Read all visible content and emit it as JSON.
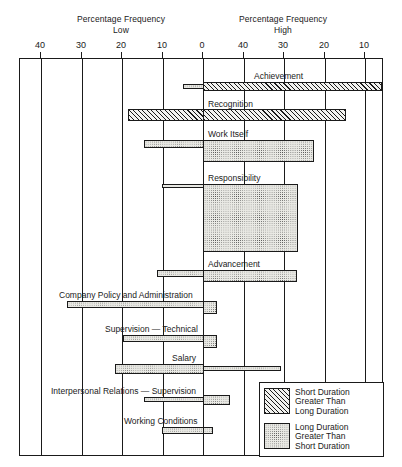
{
  "chart_data": {
    "type": "bar",
    "title": "",
    "subtitle": "",
    "orientation": "horizontal-diverging",
    "axes": {
      "left": {
        "title_line1": "Percentage Frequency",
        "title_line2": "Low",
        "ticks": [
          40,
          30,
          20,
          10,
          0
        ],
        "range": [
          40,
          0
        ],
        "direction": "decreasing-rightward"
      },
      "right": {
        "title_line1": "Percentage Frequency",
        "title_line2": "High",
        "ticks": [
          0,
          40,
          30,
          20,
          10
        ],
        "range": [
          0,
          50
        ],
        "direction": "increasing-leftward"
      }
    },
    "grid": true,
    "legend": {
      "position": "bottom-right-inside",
      "entries": [
        {
          "pattern": "hatch",
          "line1": "Short Duration",
          "line2": "Greater Than",
          "line3": "Long Duration"
        },
        {
          "pattern": "dots",
          "line1": "Long Duration",
          "line2": "Greater Than",
          "line3": "Short Duration"
        }
      ]
    },
    "categories": [
      "Achievement",
      "Recognition",
      "Work Itself",
      "Responsibility",
      "Advancement",
      "Company Policy and Administration",
      "Supervision — Technical",
      "Salary",
      "Interpersonal Relations — Supervision",
      "Working Conditions"
    ],
    "series": [
      {
        "name": "Low (left of centre)",
        "values": [
          5,
          18.5,
          14.5,
          10,
          8,
          40,
          20,
          25,
          13,
          9
        ]
      },
      {
        "name": "High (right of centre)",
        "values": [
          44,
          35,
          27,
          22,
          23,
          3,
          4,
          6,
          4,
          3
        ]
      }
    ],
    "bars": [
      {
        "label": "Achievement",
        "label_x": 253,
        "label_y": 70,
        "low": {
          "x": 182,
          "w": 21,
          "y": 83,
          "h": 5,
          "pattern": "dots"
        },
        "high": {
          "x": 202,
          "w": 179,
          "y": 81,
          "h": 9,
          "pattern": "hatch"
        }
      },
      {
        "label": "Recognition",
        "label_x": 207,
        "label_y": 98,
        "low": {
          "x": 127,
          "w": 76,
          "y": 108,
          "h": 12,
          "pattern": "hatch"
        },
        "high": {
          "x": 202,
          "w": 143,
          "y": 108,
          "h": 12,
          "pattern": "hatch"
        }
      },
      {
        "label": "Work Itself",
        "label_x": 207,
        "label_y": 128,
        "low": {
          "x": 143,
          "w": 60,
          "y": 139,
          "h": 8,
          "pattern": "dots"
        },
        "high": {
          "x": 202,
          "w": 111,
          "y": 139,
          "h": 22,
          "pattern": "dots"
        }
      },
      {
        "label": "Responsibility",
        "label_x": 207,
        "label_y": 172,
        "low": {
          "x": 161,
          "w": 42,
          "y": 183,
          "h": 4,
          "pattern": "dots"
        },
        "high": {
          "x": 202,
          "w": 95,
          "y": 183,
          "h": 68,
          "pattern": "dots"
        }
      },
      {
        "label": "Advancement",
        "label_x": 207,
        "label_y": 258,
        "low": {
          "x": 156,
          "w": 47,
          "y": 269,
          "h": 7,
          "pattern": "dots"
        },
        "high": {
          "x": 202,
          "w": 94,
          "y": 269,
          "h": 12,
          "pattern": "dots"
        }
      },
      {
        "label": "Company Policy and Administration",
        "label_x": 58,
        "label_y": 289,
        "low": {
          "x": 66,
          "w": 137,
          "y": 300,
          "h": 7,
          "pattern": "dots"
        },
        "high": {
          "x": 202,
          "w": 14,
          "y": 300,
          "h": 13,
          "pattern": "dots"
        }
      },
      {
        "label": "Supervision — Technical",
        "label_x": 104,
        "label_y": 323,
        "low": {
          "x": 122,
          "w": 81,
          "y": 334,
          "h": 7,
          "pattern": "dots"
        },
        "high": {
          "x": 202,
          "w": 14,
          "y": 334,
          "h": 13,
          "pattern": "dots"
        }
      },
      {
        "label": "Salary",
        "label_x": 171,
        "label_y": 352,
        "low": {
          "x": 114,
          "w": 89,
          "y": 363,
          "h": 10,
          "pattern": "dots"
        },
        "high": {
          "x": 202,
          "w": 78,
          "y": 365,
          "h": 5,
          "pattern": "dots"
        }
      },
      {
        "label": "Interpersonal Relations — Supervision",
        "label_x": 50,
        "label_y": 385,
        "low": {
          "x": 143,
          "w": 60,
          "y": 396,
          "h": 5,
          "pattern": "dots"
        },
        "high": {
          "x": 202,
          "w": 27,
          "y": 394,
          "h": 10,
          "pattern": "dots"
        }
      },
      {
        "label": "Working Conditions",
        "label_x": 123,
        "label_y": 415,
        "low": {
          "x": 161,
          "w": 42,
          "y": 426,
          "h": 7,
          "pattern": "dots"
        },
        "high": {
          "x": 202,
          "w": 10,
          "y": 426,
          "h": 7,
          "pattern": "dots"
        }
      }
    ]
  },
  "layout": {
    "plot": {
      "x": 19,
      "y": 58,
      "w": 364,
      "h": 398
    },
    "gridlines_x": [
      40,
      81,
      121,
      162,
      202,
      243,
      283,
      324,
      364
    ],
    "tick_labels": [
      {
        "text": "40",
        "x": 40
      },
      {
        "text": "30",
        "x": 81
      },
      {
        "text": "20",
        "x": 121
      },
      {
        "text": "10",
        "x": 162
      },
      {
        "text": "0",
        "x": 202
      },
      {
        "text": "40",
        "x": 243
      },
      {
        "text": "30",
        "x": 283
      },
      {
        "text": "20",
        "x": 324
      },
      {
        "text": "10",
        "x": 364
      }
    ],
    "axis_title_left_x": 121,
    "axis_title_right_x": 283,
    "legend": {
      "x": 258,
      "y": 381,
      "w": 125,
      "h": 75
    }
  }
}
